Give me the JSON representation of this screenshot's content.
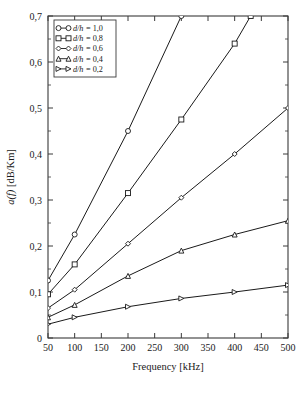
{
  "chart_data": {
    "type": "line",
    "title": "",
    "xlabel": "Frequency [kHz]",
    "ylabel": "a(f) [dB/Km]",
    "xlim": [
      50,
      500
    ],
    "ylim": [
      0,
      0.7
    ],
    "xticks": [
      50,
      100,
      150,
      200,
      250,
      300,
      350,
      400,
      450,
      500
    ],
    "xticklabels": [
      "50",
      "100",
      "150",
      "200",
      "250",
      "300",
      "350",
      "400",
      "450",
      "500"
    ],
    "yticks": [
      0,
      0.1,
      0.2,
      0.3,
      0.4,
      0.5,
      0.6,
      0.7
    ],
    "yticklabels": [
      "0",
      "0,1",
      "0,2",
      "0,3",
      "0,4",
      "0,5",
      "0,6",
      "0,7"
    ],
    "grid": false,
    "legend_position": "upper-left",
    "marker_x": [
      50,
      100,
      200,
      300,
      400,
      500
    ],
    "series": [
      {
        "name": "d/h = 1,0",
        "label_prefix": "d/h",
        "label_value": "1,0",
        "marker": "circle",
        "color": "#1a1a1a",
        "x": [
          50,
          100,
          200,
          300
        ],
        "values": [
          0.125,
          0.225,
          0.45,
          0.7
        ]
      },
      {
        "name": "d/h = 0,8",
        "label_prefix": "d/h",
        "label_value": "0,8",
        "marker": "square",
        "color": "#1a1a1a",
        "x": [
          50,
          100,
          200,
          300,
          400,
          430
        ],
        "values": [
          0.095,
          0.16,
          0.315,
          0.475,
          0.64,
          0.7
        ]
      },
      {
        "name": "d/h = 0,6",
        "label_prefix": "d/h",
        "label_value": "0,6",
        "marker": "diamond",
        "color": "#1a1a1a",
        "x": [
          50,
          100,
          200,
          300,
          400,
          500
        ],
        "values": [
          0.065,
          0.105,
          0.205,
          0.305,
          0.4,
          0.5
        ]
      },
      {
        "name": "d/h = 0,4",
        "label_prefix": "d/h",
        "label_value": "0,4",
        "marker": "triangle-up",
        "color": "#1a1a1a",
        "x": [
          50,
          100,
          200,
          300,
          400,
          500
        ],
        "values": [
          0.045,
          0.072,
          0.135,
          0.19,
          0.225,
          0.255
        ]
      },
      {
        "name": "d/h = 0,2",
        "label_prefix": "d/h",
        "label_value": "0,2",
        "marker": "triangle-right",
        "color": "#1a1a1a",
        "x": [
          50,
          100,
          200,
          300,
          400,
          500
        ],
        "values": [
          0.03,
          0.045,
          0.068,
          0.086,
          0.1,
          0.115
        ]
      }
    ]
  },
  "legend": {
    "items": [
      {
        "prefix": "d/h",
        "eq": "= 1,0",
        "marker": "circle"
      },
      {
        "prefix": "d/h",
        "eq": "= 0,8",
        "marker": "square"
      },
      {
        "prefix": "d/h",
        "eq": "= 0,6",
        "marker": "diamond"
      },
      {
        "prefix": "d/h",
        "eq": "= 0,4",
        "marker": "triangle-up"
      },
      {
        "prefix": "d/h",
        "eq": "= 0,2",
        "marker": "triangle-right"
      }
    ]
  },
  "axes": {
    "x_label": "Frequency [kHz]",
    "y_label_italic": "a(f)",
    "y_label_unit": " [dB/Km]"
  }
}
